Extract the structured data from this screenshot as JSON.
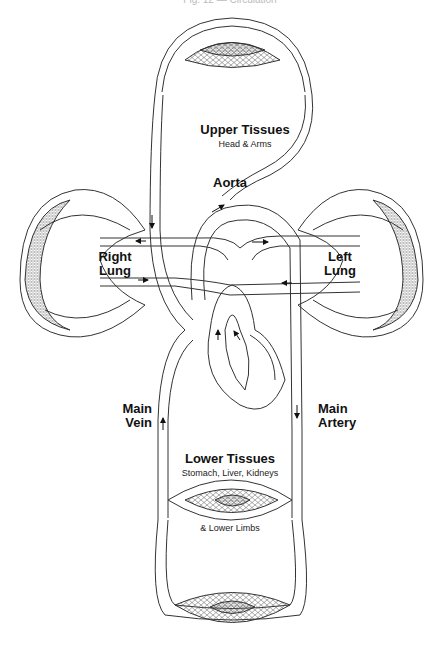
{
  "caption": "Fig. 12 — Circulation",
  "labels": {
    "upper_tissues": "Upper Tissues",
    "upper_tissues_sub": "Head & Arms",
    "aorta": "Aorta",
    "right_lung_1": "Right",
    "right_lung_2": "Lung",
    "left_lung_1": "Left",
    "left_lung_2": "Lung",
    "main_vein_1": "Main",
    "main_vein_2": "Vein",
    "main_artery_1": "Main",
    "main_artery_2": "Artery",
    "lower_tissues": "Lower Tissues",
    "lower_tissues_sub": "Stomach, Liver, Kidneys",
    "lower_limbs": "& Lower Limbs"
  },
  "colors": {
    "line": "#333333",
    "background": "#ffffff",
    "mesh": "#555555"
  }
}
